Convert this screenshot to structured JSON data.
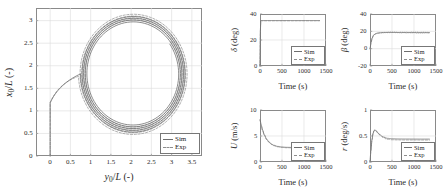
{
  "figure": {
    "background": "#ffffff",
    "sim_color": "#6e6e6e",
    "exp_color": "#9a9a9a",
    "axis_color": "#8a8a8a",
    "grid_color": "#dcdcdc"
  },
  "legend": {
    "sim_label": "Sim",
    "exp_label": "Exp"
  },
  "chart_data": [
    {
      "id": "trajectory",
      "type": "line",
      "title": "",
      "xlabel": "y0/L (-)",
      "ylabel": "x0/L (-)",
      "xlim": [
        -0.35,
        3.75
      ],
      "ylim": [
        0,
        3.28
      ],
      "xticks": [
        0,
        0.5,
        1,
        1.5,
        2,
        2.5,
        3,
        3.5
      ],
      "xticklabels": [
        "0",
        "0.5",
        "1",
        "1.5",
        "2",
        "2.5",
        "3",
        "3.5"
      ],
      "yticks": [
        0,
        0.5,
        1,
        1.5,
        2,
        2.5,
        3
      ],
      "yticklabels": [
        "0",
        "0.5",
        "1",
        "1.5",
        "2",
        "2.5",
        "3"
      ],
      "grid": true,
      "legend_position": "lower right",
      "series": [
        {
          "name": "Sim",
          "style": "solid",
          "description": "Turning-circle trajectory: straight approach along y0/L = 0 from x0/L = 0 up to about x0/L = 1.25, then a clockwise spiral of slowly decreasing radius centred near (2.05, 1.82), outer radius about 1.30 settling toward 1.12",
          "x": [
            0.0,
            0.0,
            0.0,
            0.0,
            0.0,
            0.01,
            0.02,
            0.05,
            0.09,
            0.15,
            0.23,
            0.34,
            0.47,
            0.63,
            0.81,
            1.02,
            1.25,
            1.49,
            1.74,
            1.99,
            2.24,
            2.48,
            2.7,
            2.91,
            3.08,
            3.21,
            3.3,
            3.34,
            3.34,
            3.3,
            3.21,
            3.08,
            2.92,
            2.73,
            2.51,
            2.28,
            2.04,
            1.8,
            1.57,
            1.35,
            1.16,
            1.0,
            0.88,
            0.8,
            0.77,
            0.79,
            0.86,
            0.97,
            1.12,
            1.3,
            1.5,
            1.72,
            1.95,
            2.17,
            2.39,
            2.58,
            2.75,
            2.89,
            2.99,
            3.05,
            3.07,
            3.05,
            2.98,
            2.88,
            2.74,
            2.57,
            2.38,
            2.17,
            1.96,
            1.76,
            1.56,
            1.39,
            1.24,
            1.13,
            1.06,
            1.03,
            1.04,
            1.09,
            1.18,
            1.31,
            1.46,
            1.63,
            1.81,
            2.0,
            2.18,
            2.35,
            2.5,
            2.63,
            2.73,
            2.79,
            2.82,
            2.81,
            2.76,
            2.69,
            2.58,
            2.45,
            2.31,
            2.15,
            1.99,
            1.84,
            1.7,
            1.58,
            1.48,
            1.41,
            1.37,
            1.36,
            1.39,
            1.44,
            1.53,
            1.63,
            1.76,
            1.9,
            2.04,
            2.18,
            2.32,
            2.44,
            2.54,
            2.62,
            2.67,
            2.7,
            2.69,
            2.66,
            2.6
          ],
          "y": [
            0.0,
            0.14,
            0.28,
            0.42,
            0.56,
            0.7,
            0.84,
            0.97,
            1.1,
            1.23,
            1.35,
            1.47,
            1.58,
            1.68,
            1.78,
            1.86,
            1.93,
            1.98,
            2.02,
            2.04,
            2.05,
            2.03,
            2.0,
            1.95,
            1.88,
            1.79,
            1.69,
            1.57,
            1.45,
            1.32,
            1.19,
            1.06,
            0.94,
            0.83,
            0.73,
            0.65,
            0.59,
            0.55,
            0.54,
            0.55,
            0.58,
            0.64,
            0.72,
            0.82,
            0.94,
            1.07,
            1.21,
            1.35,
            1.49,
            1.63,
            1.76,
            1.87,
            1.96,
            2.03,
            2.08,
            2.1,
            2.1,
            2.07,
            2.02,
            1.95,
            1.86,
            1.75,
            1.64,
            1.52,
            1.39,
            1.27,
            1.15,
            1.04,
            0.95,
            0.88,
            0.83,
            0.8,
            0.8,
            0.82,
            0.87,
            0.94,
            1.03,
            1.13,
            1.25,
            1.37,
            1.49,
            1.61,
            1.72,
            1.82,
            1.9,
            1.96,
            2.0,
            2.02,
            2.01,
            1.98,
            1.93,
            1.86,
            1.78,
            1.69,
            1.59,
            1.49,
            1.39,
            1.3,
            1.22,
            1.16,
            1.12,
            1.1,
            1.1,
            1.13,
            1.18,
            1.25,
            1.33,
            1.43,
            1.53,
            1.63,
            1.73,
            1.82,
            1.89,
            1.95,
            1.98,
            1.99,
            1.98,
            1.95,
            1.9,
            1.84,
            1.77,
            1.69,
            1.61
          ]
        },
        {
          "name": "Exp",
          "style": "dashed",
          "description": "Experimental trajectory, nearly coincident with Sim but with a slightly larger spiral radius (offset about +0.05 in radius)"
        }
      ]
    },
    {
      "id": "rudder-angle",
      "type": "line",
      "title": "",
      "xlabel": "Time (s)",
      "ylabel": "δ (deg)",
      "xlim": [
        0,
        1500
      ],
      "ylim": [
        0,
        40
      ],
      "xticks": [
        0,
        500,
        1000,
        1500
      ],
      "xticklabels": [
        "0",
        "500",
        "1000",
        "1500"
      ],
      "yticks": [
        0,
        20,
        40
      ],
      "yticklabels": [
        "0",
        "20",
        "40"
      ],
      "grid": true,
      "legend_position": "lower right",
      "series": [
        {
          "name": "Sim",
          "style": "solid",
          "description": "Rudder steps from 0 deg to 35 deg within the first few seconds and holds constant at 35 deg until about 1350 s",
          "x": [
            0,
            5,
            12,
            1350
          ],
          "y": [
            0,
            18,
            35,
            35
          ]
        },
        {
          "name": "Exp",
          "style": "dashed",
          "description": "Identical commanded rudder, overlapping the Sim trace at 35 deg"
        }
      ]
    },
    {
      "id": "drift-angle",
      "type": "line",
      "title": "",
      "xlabel": "Time (s)",
      "ylabel": "β (deg)",
      "xlim": [
        0,
        1500
      ],
      "ylim": [
        -20,
        40
      ],
      "xticks": [
        0,
        500,
        1000,
        1500
      ],
      "xticklabels": [
        "0",
        "500",
        "1000",
        "1500"
      ],
      "yticks": [
        -20,
        0,
        20,
        40
      ],
      "yticklabels": [
        "-20",
        "0",
        "20",
        "40"
      ],
      "grid": true,
      "legend_position": "lower right",
      "series": [
        {
          "name": "Sim",
          "style": "solid",
          "description": "Drift angle rises steeply from 0 deg, reaching about 18 deg by 200 s and holding near 18.5 deg through 1350 s",
          "x": [
            0,
            25,
            50,
            80,
            120,
            170,
            230,
            300,
            400,
            550,
            700,
            900,
            1100,
            1350
          ],
          "y": [
            0,
            7.5,
            12.5,
            15.5,
            17.2,
            18.0,
            18.4,
            18.6,
            18.7,
            18.7,
            18.6,
            18.6,
            18.5,
            18.5
          ]
        },
        {
          "name": "Exp",
          "style": "dashed",
          "description": "Experimental drift angle, overlapping Sim with small fluctuations about 18.5 deg"
        }
      ]
    },
    {
      "id": "speed",
      "type": "line",
      "title": "",
      "xlabel": "Time (s)",
      "ylabel": "U (m/s)",
      "xlim": [
        0,
        1500
      ],
      "ylim": [
        0,
        10
      ],
      "xticks": [
        0,
        500,
        1000,
        1500
      ],
      "xticklabels": [
        "0",
        "500",
        "1000",
        "1500"
      ],
      "yticks": [
        0,
        5,
        10
      ],
      "yticklabels": [
        "0",
        "5",
        "10"
      ],
      "grid": true,
      "legend_position": "lower right",
      "series": [
        {
          "name": "Sim",
          "style": "solid",
          "description": "Speed decays from about 8.1 m/s at t = 0 down to a steady 2.8 m/s by roughly 600 s",
          "x": [
            0,
            30,
            60,
            100,
            150,
            200,
            260,
            320,
            400,
            500,
            600,
            750,
            900,
            1100,
            1350
          ],
          "y": [
            8.1,
            7.0,
            6.1,
            5.2,
            4.4,
            3.9,
            3.45,
            3.2,
            3.0,
            2.88,
            2.82,
            2.8,
            2.8,
            2.8,
            2.8
          ]
        },
        {
          "name": "Exp",
          "style": "dashed",
          "description": "Experimental speed decay, essentially overlapping the Sim curve"
        }
      ]
    },
    {
      "id": "yaw-rate",
      "type": "line",
      "title": "",
      "xlabel": "Time (s)",
      "ylabel": "r (deg/s)",
      "xlim": [
        0,
        1500
      ],
      "ylim": [
        0,
        1
      ],
      "xticks": [
        0,
        500,
        1000,
        1500
      ],
      "xticklabels": [
        "0",
        "500",
        "1000",
        "1500"
      ],
      "yticks": [
        0,
        0.5,
        1
      ],
      "yticklabels": [
        "0",
        "0.5",
        "1"
      ],
      "grid": true,
      "legend_position": "lower right",
      "series": [
        {
          "name": "Sim",
          "style": "solid",
          "description": "Yaw rate rises to an overshoot peak of about 0.62 deg/s near 110 s then decays to a steady 0.44 deg/s",
          "x": [
            0,
            20,
            45,
            70,
            90,
            110,
            140,
            180,
            230,
            300,
            400,
            500,
            650,
            800,
            1000,
            1200,
            1350
          ],
          "y": [
            0.0,
            0.22,
            0.43,
            0.55,
            0.6,
            0.62,
            0.6,
            0.56,
            0.52,
            0.48,
            0.455,
            0.447,
            0.443,
            0.442,
            0.441,
            0.44,
            0.44
          ]
        },
        {
          "name": "Exp",
          "style": "dashed",
          "description": "Experimental yaw rate, slightly lower in the settled region at about 0.425 deg/s"
        }
      ]
    }
  ]
}
